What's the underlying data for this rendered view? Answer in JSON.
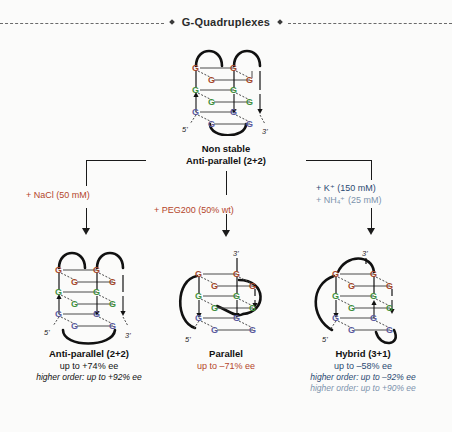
{
  "header": {
    "title": "G-Quadruplexes",
    "left_rule": "dashed-rule",
    "right_rule": "dashed-rule",
    "bullet": "diamond-bullet"
  },
  "colors": {
    "red": "#b4452a",
    "blue": "#2b4a72",
    "blue_light": "#7d93ad",
    "black": "#111111",
    "g_top": "#a4472c",
    "g_mid": "#3f8f3f",
    "g_bottom": "#5a5a9e",
    "background": "#fbfbfa"
  },
  "parent": {
    "line1": "Non stable",
    "line2": "Anti-parallel (2+2)",
    "structure": {
      "name": "antiparallel-quadruplex",
      "five_prime": "5'",
      "three_prime": "3'",
      "base_letter": "G",
      "tetrad_layers": 3,
      "bases_per_layer": 4
    }
  },
  "branches": [
    {
      "id": "left",
      "condition_lines": [
        {
          "text": "+ NaCl (50 mM)",
          "color": "red"
        }
      ],
      "result": {
        "title": "Anti-parallel (2+2)",
        "value": "up to +74% ee",
        "value_color": "black",
        "notes": [
          {
            "text": "higher order:  up to +92% ee",
            "color": "black"
          }
        ],
        "structure": {
          "name": "antiparallel-quadruplex",
          "five_prime": "5'",
          "three_prime": "3'",
          "base_letter": "G"
        }
      }
    },
    {
      "id": "center",
      "condition_lines": [
        {
          "text": "+ PEG200 (50% wt)",
          "color": "red"
        }
      ],
      "result": {
        "title": "Parallel",
        "value": "up to –71% ee",
        "value_color": "red",
        "notes": [],
        "structure": {
          "name": "parallel-quadruplex",
          "five_prime": "5'",
          "three_prime": "3'",
          "base_letter": "G"
        }
      }
    },
    {
      "id": "right",
      "condition_lines": [
        {
          "text": "+ K⁺ (150 mM)",
          "color": "blue"
        },
        {
          "text": "+ NH₄⁺ (25 mM)",
          "color": "blue_light"
        }
      ],
      "result": {
        "title": "Hybrid (3+1)",
        "value": "up to –58% ee",
        "value_color": "blue",
        "notes": [
          {
            "text": "higher order: up to –92% ee",
            "color": "blue"
          },
          {
            "text": "higher order: up to +90% ee",
            "color": "blue_light"
          }
        ],
        "structure": {
          "name": "hybrid-quadruplex",
          "five_prime": "5'",
          "three_prime": "3'",
          "base_letter": "G"
        }
      }
    }
  ]
}
